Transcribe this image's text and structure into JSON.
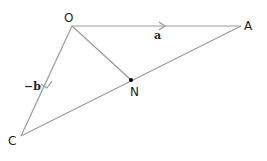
{
  "diagram": {
    "points": {
      "O": {
        "label": "O",
        "x": 72,
        "y": 26
      },
      "A": {
        "label": "A",
        "x": 241,
        "y": 26
      },
      "C": {
        "label": "C",
        "x": 21,
        "y": 136
      },
      "N": {
        "label": "N",
        "x": 131,
        "y": 80
      }
    },
    "vectors": {
      "OA": {
        "label": "a"
      },
      "OC": {
        "label": "−b"
      }
    },
    "segments": [
      "OA",
      "OC",
      "CA",
      "ON"
    ],
    "colors": {
      "line": "#9a9a9a",
      "text": "#222222",
      "point": "#000000"
    }
  }
}
